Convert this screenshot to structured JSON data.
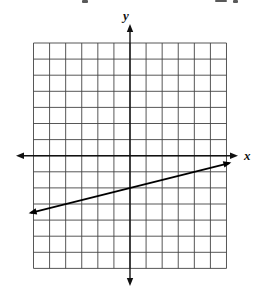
{
  "figure": {
    "background_color": "#ffffff",
    "grid_color": "#444444",
    "axis_color": "#111111",
    "line_color": "#000000"
  },
  "chart_data": {
    "type": "line",
    "title": "",
    "xlabel": "x",
    "ylabel": "y",
    "x_range": [
      -6,
      6
    ],
    "y_range": [
      -7,
      7
    ],
    "grid_step": 1,
    "grid": true,
    "axes_through_origin": true,
    "axis_end_arrows": true,
    "tick_labels": "none",
    "series": [
      {
        "name": "graphed-line",
        "equation": "y = (1/4)x - 2",
        "slope": 0.25,
        "y_intercept": -2,
        "x_intercept": 8,
        "points": [
          [
            -6,
            -3.5
          ],
          [
            6,
            -0.5
          ]
        ],
        "endpoint_arrows": true,
        "color": "#000000"
      }
    ]
  }
}
